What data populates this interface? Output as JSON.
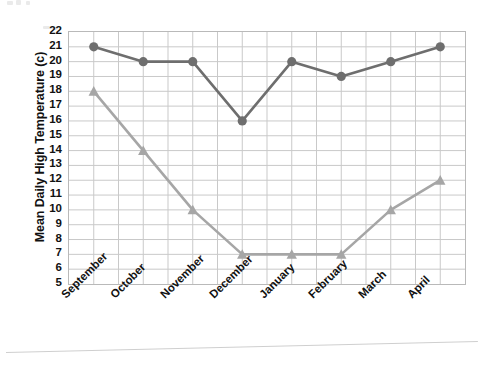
{
  "chart_data": {
    "type": "line",
    "title": "",
    "xlabel": "",
    "ylabel": "Mean Daily High Temperature (c)",
    "categories": [
      "September",
      "October",
      "November",
      "December",
      "January",
      "February",
      "March",
      "April"
    ],
    "series": [
      {
        "name": "series-dark",
        "marker": "circle",
        "color": "#6e6e6e",
        "values": [
          21,
          20,
          20,
          16,
          20,
          19,
          20,
          21
        ]
      },
      {
        "name": "series-light",
        "marker": "triangle",
        "color": "#a6a6a6",
        "values": [
          18,
          14,
          10,
          7,
          7,
          7,
          10,
          12
        ]
      }
    ],
    "ylim": [
      5,
      22
    ],
    "ytick_labels": [
      "22",
      "21",
      "20",
      "19",
      "18",
      "17",
      "16",
      "15",
      "14",
      "13",
      "12",
      "11",
      "10",
      "9",
      "8",
      "7",
      "6",
      "5"
    ],
    "ytick_values": [
      22,
      21,
      20,
      19,
      18,
      17,
      16,
      15,
      14,
      13,
      12,
      11,
      10,
      9,
      8,
      7,
      6,
      5
    ],
    "grid": true,
    "grid_horizontal": true,
    "grid_vertical": true,
    "legend": "none",
    "legend_position": "none"
  },
  "style": {
    "grid_color": "#c9c9c9",
    "frame_color": "#b9b9b9",
    "text_color": "#111111",
    "background": "#ffffff"
  }
}
